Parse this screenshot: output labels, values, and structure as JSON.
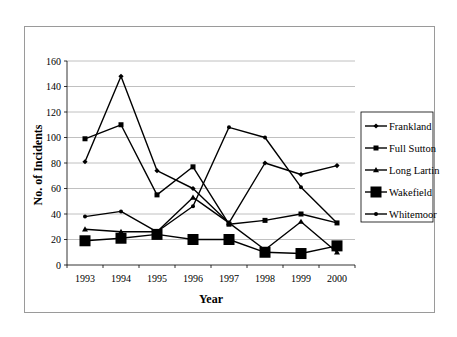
{
  "chart_data": {
    "type": "line",
    "title": "",
    "xlabel": "Year",
    "ylabel": "No. of Incidents",
    "x": [
      "1993",
      "1994",
      "1995",
      "1996",
      "1997",
      "1998",
      "1999",
      "2000"
    ],
    "yticks": [
      "0",
      "20",
      "40",
      "60",
      "80",
      "100",
      "120",
      "140",
      "160"
    ],
    "ylim": [
      0,
      160
    ],
    "grid": "horizontal",
    "legend_position": "right",
    "series": [
      {
        "name": "Frankland",
        "marker": "diamond",
        "values": [
          81,
          148,
          74,
          60,
          33,
          80,
          71,
          78
        ]
      },
      {
        "name": "Full Sutton",
        "marker": "square",
        "values": [
          99,
          110,
          55,
          77,
          32,
          35,
          40,
          33
        ]
      },
      {
        "name": "Long Lartin",
        "marker": "triangle",
        "values": [
          28,
          26,
          26,
          53,
          33,
          12,
          34,
          10
        ]
      },
      {
        "name": "Wakefield",
        "marker": "large-square",
        "values": [
          19,
          21,
          24,
          20,
          20,
          10,
          9,
          15
        ]
      },
      {
        "name": "Whitemoor",
        "marker": "circle",
        "values": [
          38,
          42,
          26,
          46,
          108,
          100,
          61,
          33
        ]
      }
    ]
  }
}
